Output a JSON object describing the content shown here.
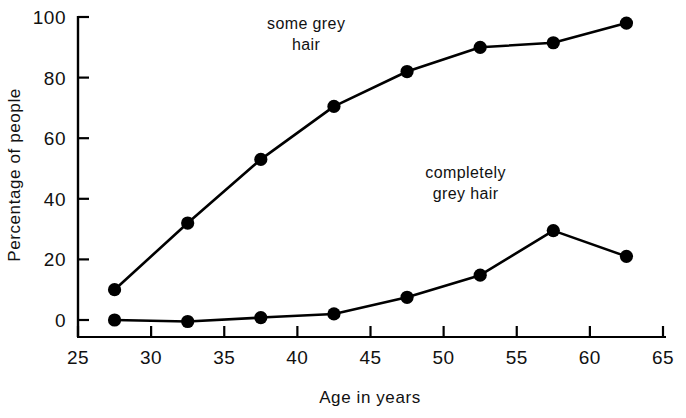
{
  "chart_data": {
    "type": "line",
    "title": "",
    "xlabel": "Age in years",
    "ylabel": "Percentage of people",
    "xlim": [
      25,
      65
    ],
    "ylim": [
      0,
      100
    ],
    "xticks": [
      25,
      30,
      35,
      40,
      45,
      50,
      55,
      60,
      65
    ],
    "yticks": [
      0,
      20,
      40,
      60,
      80,
      100
    ],
    "xtick_labels": [
      "25",
      "30",
      "35",
      "40",
      "45",
      "50",
      "55",
      "60",
      "65"
    ],
    "ytick_labels": [
      "0",
      "20",
      "40",
      "60",
      "80",
      "100"
    ],
    "grid": false,
    "legend_position": "inline-annotation",
    "x": [
      27.5,
      32.5,
      37.5,
      42.5,
      47.5,
      52.5,
      57.5,
      62.5
    ],
    "series": [
      {
        "name": "some grey hair",
        "marker": "filled-circle",
        "color": "#000000",
        "values": [
          10,
          32,
          53,
          70.5,
          82,
          90,
          91.5,
          98
        ]
      },
      {
        "name": "completely grey hair",
        "marker": "filled-circle",
        "color": "#000000",
        "values": [
          0,
          -0.5,
          0.8,
          2,
          7.5,
          14.8,
          29.5,
          21
        ]
      }
    ],
    "annotations": [
      {
        "text_line1": "some grey",
        "text_line2": "hair",
        "x": 40.6,
        "y": 96
      },
      {
        "text_line1": "completely",
        "text_line2": "grey hair",
        "x": 51.5,
        "y": 47
      }
    ]
  },
  "axis": {
    "x_title": "Age in years",
    "y_title": "Percentage of people"
  },
  "colors": {
    "ink": "#000000",
    "background": "#ffffff"
  }
}
